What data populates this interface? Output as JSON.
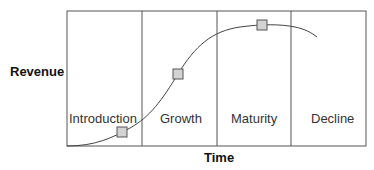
{
  "diagram": {
    "y_axis_label": "Revenue",
    "x_axis_label": "Time",
    "stages": [
      {
        "label": "Introduction"
      },
      {
        "label": "Growth"
      },
      {
        "label": "Maturity"
      },
      {
        "label": "Decline"
      }
    ],
    "colors": {
      "line": "#444444",
      "marker_fill": "#d3d3d3",
      "marker_stroke": "#555555"
    }
  }
}
